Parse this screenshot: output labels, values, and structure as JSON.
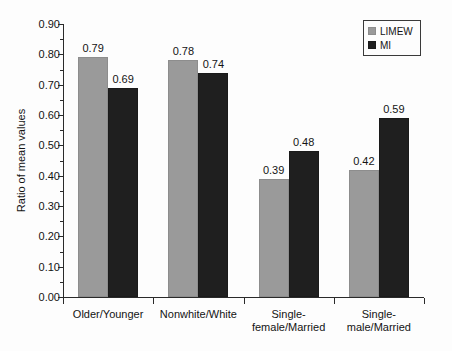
{
  "chart_data": {
    "type": "bar",
    "title": "",
    "xlabel": "",
    "ylabel": "Ratio of mean values",
    "ylim": [
      0.0,
      0.9
    ],
    "ytick_step": 0.1,
    "grid": false,
    "legend_position": "top-right",
    "categories": [
      "Older/Younger",
      "Nonwhite/White",
      "Single-\nfemale/Married",
      "Single-male/Married"
    ],
    "ytick_labels": [
      "0.00",
      "0.10",
      "0.20",
      "0.30",
      "0.40",
      "0.50",
      "0.60",
      "0.70",
      "0.80",
      "0.90"
    ],
    "ytick_values": [
      0.0,
      0.1,
      0.2,
      0.3,
      0.4,
      0.5,
      0.6,
      0.7,
      0.8,
      0.9
    ],
    "series": [
      {
        "name": "LIMEW",
        "color": "#9a9a9a",
        "values": [
          0.79,
          0.78,
          0.39,
          0.42
        ],
        "labels": [
          "0.79",
          "0.78",
          "0.39",
          "0.42"
        ]
      },
      {
        "name": "MI",
        "color": "#1f1f1f",
        "values": [
          0.69,
          0.74,
          0.48,
          0.59
        ],
        "labels": [
          "0.69",
          "0.74",
          "0.48",
          "0.59"
        ]
      }
    ]
  },
  "legend": {
    "items": [
      {
        "label": "LIMEW",
        "swatch": "limew"
      },
      {
        "label": "MI",
        "swatch": "mi"
      }
    ]
  }
}
